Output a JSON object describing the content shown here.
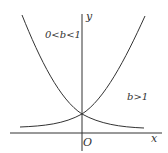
{
  "diagram": {
    "type": "exponential-function-graphs",
    "axes": {
      "x_label": "x",
      "y_label": "y",
      "origin_label": "O"
    },
    "curves": [
      {
        "name": "decreasing",
        "condition": "0<b<1",
        "color": "#333333"
      },
      {
        "name": "increasing",
        "condition": "b>1",
        "color": "#333333"
      }
    ],
    "labels": {
      "left_curve": "0<b<1",
      "right_curve": "b>1"
    }
  }
}
